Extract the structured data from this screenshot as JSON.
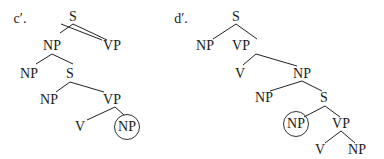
{
  "trees": [
    {
      "label": "c′.",
      "label_pos": [
        20,
        19
      ],
      "nodes": [
        {
          "id": "S1",
          "text": "S",
          "x": 73,
          "y": 17
        },
        {
          "id": "NP1",
          "text": "NP",
          "x": 52,
          "y": 46
        },
        {
          "id": "VP1",
          "text": "VP",
          "x": 112,
          "y": 46
        },
        {
          "id": "NP2",
          "text": "NP",
          "x": 29,
          "y": 74
        },
        {
          "id": "S2",
          "text": "S",
          "x": 70,
          "y": 74
        },
        {
          "id": "NP3",
          "text": "NP",
          "x": 49,
          "y": 100
        },
        {
          "id": "VP2",
          "text": "VP",
          "x": 112,
          "y": 100
        },
        {
          "id": "V1",
          "text": "V",
          "x": 80,
          "y": 127
        },
        {
          "id": "NP4",
          "text": "NP",
          "x": 127,
          "y": 127,
          "circled": true
        }
      ],
      "edges": [
        [
          61,
          24,
          102,
          40
        ],
        [
          61,
          24,
          61,
          24
        ],
        [
          73,
          24,
          60,
          33
        ],
        [
          73,
          24,
          107,
          40
        ],
        [
          52,
          54,
          36,
          64
        ],
        [
          52,
          54,
          73,
          64
        ],
        [
          70,
          82,
          56,
          92
        ],
        [
          70,
          82,
          104,
          92
        ],
        [
          115,
          107,
          87,
          120
        ],
        [
          115,
          107,
          124,
          115
        ]
      ]
    },
    {
      "label": "d′.",
      "label_pos": [
        181,
        19
      ],
      "nodes": [
        {
          "id": "S1",
          "text": "S",
          "x": 236,
          "y": 17
        },
        {
          "id": "NP1",
          "text": "NP",
          "x": 205,
          "y": 46
        },
        {
          "id": "VP1",
          "text": "VP",
          "x": 241,
          "y": 46
        },
        {
          "id": "V1",
          "text": "V",
          "x": 240,
          "y": 74
        },
        {
          "id": "NP2",
          "text": "NP",
          "x": 302,
          "y": 74
        },
        {
          "id": "NP3",
          "text": "NP",
          "x": 264,
          "y": 98
        },
        {
          "id": "S2",
          "text": "S",
          "x": 324,
          "y": 98
        },
        {
          "id": "NP4",
          "text": "NP",
          "x": 296,
          "y": 124,
          "circled": true
        },
        {
          "id": "VP2",
          "text": "VP",
          "x": 341,
          "y": 124
        },
        {
          "id": "V2",
          "text": "V",
          "x": 320,
          "y": 150
        },
        {
          "id": "NP5",
          "text": "NP",
          "x": 357,
          "y": 150
        }
      ],
      "edges": [
        [
          236,
          24,
          213,
          39
        ],
        [
          236,
          24,
          257,
          39
        ],
        [
          256,
          54,
          243,
          65
        ],
        [
          256,
          54,
          297,
          66
        ],
        [
          302,
          81,
          270,
          91
        ],
        [
          302,
          81,
          322,
          91
        ],
        [
          325,
          106,
          304,
          117
        ],
        [
          325,
          106,
          340,
          117
        ],
        [
          341,
          131,
          325,
          143
        ],
        [
          341,
          131,
          355,
          143
        ]
      ]
    }
  ]
}
